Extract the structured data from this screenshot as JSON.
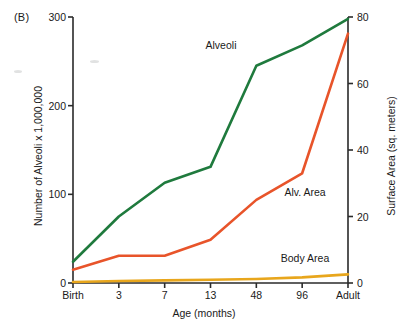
{
  "panel": {
    "label": "(B)"
  },
  "chart_data": {
    "type": "line",
    "title": "",
    "panel_label": "(B)",
    "xlabel": "Age (months)",
    "ylabel": "Number of Alveoli x 1,000,000",
    "y2label": "Surface Area (sq. meters)",
    "categories": [
      "Birth",
      "3",
      "7",
      "13",
      "48",
      "96",
      "Adult"
    ],
    "xtick_labels": [
      "Birth",
      "3",
      "7",
      "13",
      "48",
      "96",
      "Adult"
    ],
    "ylim": [
      0,
      300
    ],
    "ytick_labels": [
      "0",
      "100",
      "200",
      "300"
    ],
    "yticks": [
      0,
      100,
      200,
      300
    ],
    "y2lim": [
      0,
      80
    ],
    "y2tick_labels": [
      "0",
      "20",
      "40",
      "60",
      "80"
    ],
    "y2ticks": [
      0,
      20,
      40,
      60,
      80
    ],
    "grid": false,
    "legend": "inline-annotations",
    "series": [
      {
        "name": "Alveoli",
        "axis": "left",
        "color": "#1f7a3d",
        "values": [
          24,
          75,
          113,
          131,
          245,
          268,
          298
        ],
        "label_x": 221,
        "label_y": 45
      },
      {
        "name": "Alv. Area",
        "axis": "right",
        "color": "#e8542a",
        "values": [
          4,
          8.2,
          8.2,
          13,
          25,
          33,
          75
        ],
        "label_x": 305,
        "label_y": 192
      },
      {
        "name": "Body Area",
        "axis": "right",
        "color": "#e8a61c",
        "values": [
          0.3,
          0.6,
          0.8,
          1.0,
          1.2,
          1.7,
          2.6
        ],
        "label_x": 305,
        "label_y": 258
      }
    ],
    "annotations": [
      {
        "text": "Alveoli",
        "x": 221,
        "y": 45
      },
      {
        "text": "Alv. Area",
        "x": 305,
        "y": 192
      },
      {
        "text": "Body Area",
        "x": 305,
        "y": 258
      }
    ]
  },
  "axis_colors": {
    "axis_line": "#2b2b2b",
    "text": "#1a1a1a",
    "background": "#ffffff"
  }
}
